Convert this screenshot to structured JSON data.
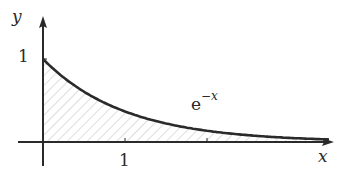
{
  "figure": {
    "function_label": "e",
    "function_exponent": "−x",
    "x_axis_label": "x",
    "y_axis_label": "y",
    "x_tick_label": "1",
    "y_tick_label": "1"
  },
  "chart_data": {
    "type": "area",
    "title": "",
    "function": "e^-x",
    "xlabel": "x",
    "ylabel": "y",
    "x": [
      0,
      0.25,
      0.5,
      0.75,
      1,
      1.5,
      2,
      2.5,
      3,
      3.5
    ],
    "values": [
      1,
      0.779,
      0.607,
      0.472,
      0.368,
      0.223,
      0.135,
      0.082,
      0.05,
      0.03
    ],
    "x_ticks": [
      1,
      2
    ],
    "x_tick_labels": [
      "1"
    ],
    "y_ticks": [
      1
    ],
    "y_tick_labels": [
      "1"
    ],
    "shaded_region": "area under curve, x from 0 to infinity (hatched)",
    "annotations": [
      "e^{-x}"
    ],
    "xlim": [
      -0.4,
      3.6
    ],
    "ylim": [
      -0.4,
      1.6
    ],
    "grid": false,
    "legend": false
  },
  "colors": {
    "curve": "#2a2a2a",
    "axes": "#2a2a2a",
    "hatch": "#bdbdbd",
    "background": "#ffffff"
  }
}
